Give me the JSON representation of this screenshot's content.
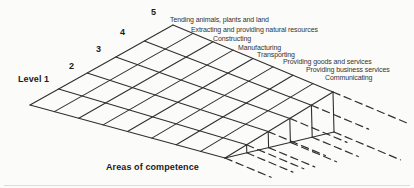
{
  "diagram": {
    "type": "competence-wedge-grid",
    "grid": {
      "rows": 5,
      "cols": 8
    },
    "levels": {
      "axis_label": "Level 1",
      "ticks": [
        "2",
        "3",
        "4",
        "5"
      ]
    },
    "areas": {
      "axis_label": "Areas of competence",
      "items": [
        "Tending animals, plants and land",
        "Extracting and providing natural resources",
        "Constructing",
        "Manufacturing",
        "Transporting",
        "Providing goods and services",
        "Providing business services",
        "Communicating"
      ]
    },
    "colors": {
      "line": "#2f2f2f",
      "text": "#1c1c1c",
      "background": "#fbfbf9"
    }
  }
}
